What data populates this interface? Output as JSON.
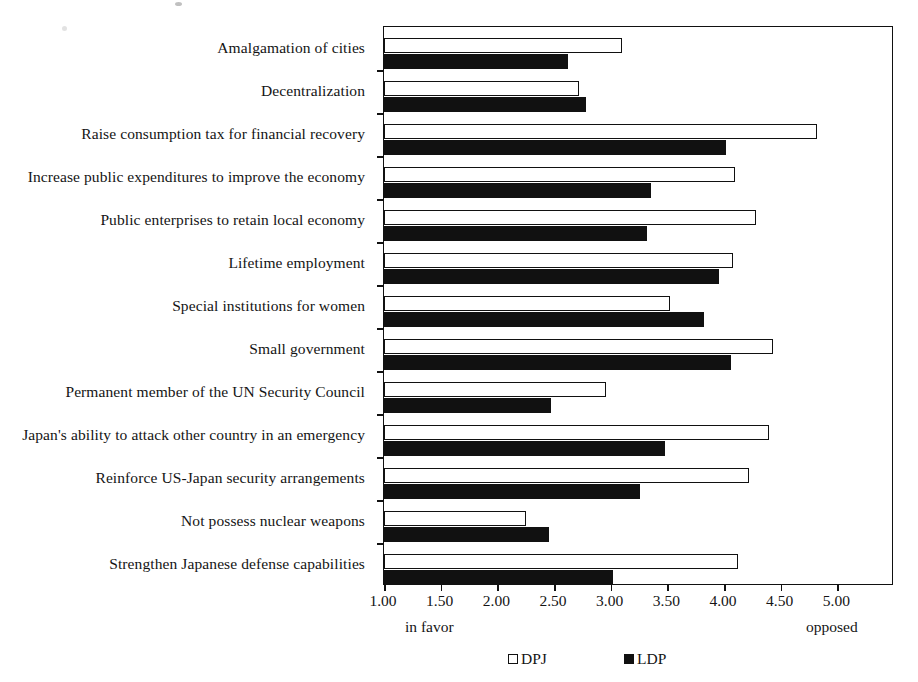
{
  "chart_data": {
    "type": "bar",
    "orientation": "horizontal",
    "title": "",
    "xlabel": "",
    "ylabel": "",
    "xlim": [
      1.0,
      5.5
    ],
    "xticks": [
      "1.00",
      "1.50",
      "2.00",
      "2.50",
      "3.00",
      "3.50",
      "4.00",
      "4.50",
      "5.00"
    ],
    "xtick_values": [
      1.0,
      1.5,
      2.0,
      2.5,
      3.0,
      3.5,
      4.0,
      4.5,
      5.0
    ],
    "grid": false,
    "legend_position": "bottom-center",
    "axis_caption_left": "in favor",
    "axis_caption_right": "opposed",
    "categories": [
      "Amalgamation of cities",
      "Decentralization",
      "Raise consumption tax for financial recovery",
      "Increase public expenditures to improve the economy",
      "Public enterprises to retain local economy",
      "Lifetime employment",
      "Special institutions for women",
      "Small government",
      "Permanent member of the UN Security Council",
      "Japan's ability to attack other country in an emergency",
      "Reinforce US-Japan security arrangements",
      "Not possess nuclear weapons",
      "Strengthen Japanese defense capabilities"
    ],
    "series": [
      {
        "name": "DPJ",
        "color": "#ffffff",
        "edge_color": "#111111",
        "values": [
          3.1,
          2.72,
          4.82,
          4.1,
          4.28,
          4.08,
          3.52,
          4.43,
          2.96,
          4.4,
          4.22,
          2.25,
          4.12
        ]
      },
      {
        "name": "LDP",
        "color": "#111111",
        "edge_color": "#111111",
        "values": [
          2.62,
          2.78,
          4.02,
          3.36,
          3.32,
          3.96,
          3.82,
          4.06,
          2.47,
          3.48,
          3.26,
          2.46,
          3.02
        ]
      }
    ]
  },
  "legend": {
    "items": [
      {
        "label": "DPJ",
        "swatch": "open-square-icon"
      },
      {
        "label": "LDP",
        "swatch": "filled-square-icon"
      }
    ]
  }
}
